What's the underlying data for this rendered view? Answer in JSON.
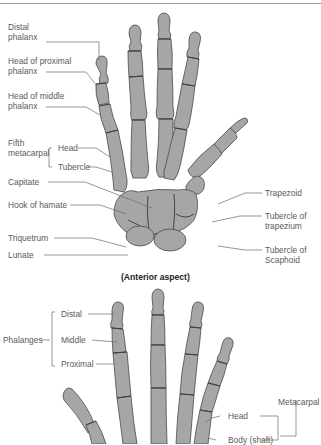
{
  "header": {
    "rule_color": "#9a9a9a"
  },
  "colors": {
    "bone_fill": "#a6a6a6",
    "bone_outline": "#4a4a4a",
    "leader_line": "#6a6a6a",
    "label_text": "#5a5a5a"
  },
  "anterior": {
    "caption": "(Anterior aspect)",
    "labels": {
      "distal_phalanx_1": "Distal",
      "distal_phalanx_2": "phalanx",
      "head_proximal_1": "Head of proximal",
      "head_proximal_2": "phalanx",
      "head_middle_1": "Head of middle",
      "head_middle_2": "phalanx",
      "fifth_metacarpal_1": "Fifth",
      "fifth_metacarpal_2": "metacarpal",
      "head": "Head",
      "tubercle": "Tubercle",
      "capitate": "Capitate",
      "hook_of_hamate": "Hook of hamate",
      "triquetrum": "Triquetrum",
      "lunate": "Lunate",
      "trapezoid": "Trapezoid",
      "tubercle_trapezium_1": "Tubercle of",
      "tubercle_trapezium_2": "trapezium",
      "tubercle_scaphoid_1": "Tubercle of",
      "tubercle_scaphoid_2": "Scaphoid"
    }
  },
  "posterior": {
    "labels": {
      "phalanges": "Phalanges",
      "distal": "Distal",
      "middle": "Middle",
      "proximal": "Proximal",
      "metacarpal": "Metacarpal",
      "head": "Head",
      "body_shaft": "Body (shaft)"
    }
  }
}
